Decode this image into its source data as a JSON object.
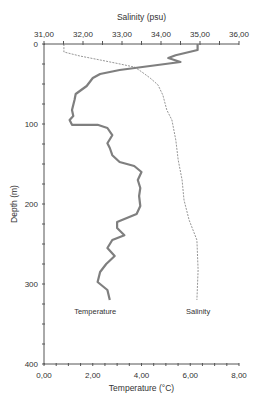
{
  "chart_data": {
    "type": "line",
    "title": "",
    "orientation": "depth-profile",
    "top_axis": {
      "label": "Salinity (psu)",
      "range": [
        31,
        36
      ],
      "ticks": [
        31,
        32,
        33,
        34,
        35,
        36
      ],
      "tick_labels": [
        "31,00",
        "32,00",
        "33,00",
        "34,00",
        "35,00",
        "36,00"
      ]
    },
    "bottom_axis": {
      "label": "Temperature (°C)",
      "range": [
        0,
        8
      ],
      "ticks": [
        0,
        2,
        4,
        6,
        8
      ],
      "tick_labels": [
        "0,00",
        "2,00",
        "4,00",
        "6,00",
        "8,00"
      ]
    },
    "y_axis": {
      "label": "Depth (m)",
      "range": [
        0,
        400
      ],
      "inverted": true,
      "ticks": [
        0,
        100,
        200,
        300,
        400
      ],
      "tick_labels": [
        "0",
        "100",
        "200",
        "300",
        "400"
      ],
      "minor_tick_step": 25
    },
    "grid": false,
    "series": [
      {
        "name": "Temperature",
        "axis": "bottom",
        "style": "solid-thick",
        "color": "#808080",
        "label_pos": {
          "x": 2.1,
          "depth": 337
        },
        "points": [
          [
            6.3,
            0
          ],
          [
            6.3,
            7.5
          ],
          [
            5.4,
            14
          ],
          [
            5.1,
            17.5
          ],
          [
            5.6,
            22.5
          ],
          [
            4.35,
            27.5
          ],
          [
            3.1,
            32.5
          ],
          [
            2.3,
            37.5
          ],
          [
            2.0,
            42.5
          ],
          [
            1.75,
            52.5
          ],
          [
            1.3,
            62.5
          ],
          [
            1.25,
            70
          ],
          [
            1.15,
            82.5
          ],
          [
            1.2,
            90
          ],
          [
            1.05,
            95
          ],
          [
            1.15,
            101
          ],
          [
            2.2,
            101
          ],
          [
            2.6,
            105
          ],
          [
            2.8,
            114
          ],
          [
            2.6,
            124
          ],
          [
            2.7,
            130
          ],
          [
            2.8,
            139
          ],
          [
            3.1,
            147.5
          ],
          [
            3.7,
            152.5
          ],
          [
            4.0,
            160
          ],
          [
            3.85,
            170
          ],
          [
            3.95,
            180
          ],
          [
            3.9,
            190
          ],
          [
            3.95,
            202.5
          ],
          [
            3.8,
            212.5
          ],
          [
            3.0,
            222.5
          ],
          [
            3.0,
            230
          ],
          [
            3.3,
            239
          ],
          [
            2.8,
            245
          ],
          [
            2.6,
            255
          ],
          [
            2.9,
            265
          ],
          [
            2.55,
            275
          ],
          [
            2.3,
            285
          ],
          [
            2.2,
            297.5
          ],
          [
            2.6,
            307.5
          ],
          [
            2.7,
            320
          ]
        ]
      },
      {
        "name": "Salinity",
        "axis": "top",
        "style": "dashed-thin",
        "color": "#888888",
        "label_pos": {
          "x": 34.95,
          "depth": 337
        },
        "points": [
          [
            31.51,
            0
          ],
          [
            31.51,
            10
          ],
          [
            31.92,
            15
          ],
          [
            32.44,
            20
          ],
          [
            32.95,
            25
          ],
          [
            33.33,
            29
          ],
          [
            33.51,
            35
          ],
          [
            33.72,
            42.5
          ],
          [
            33.92,
            51
          ],
          [
            34.05,
            64
          ],
          [
            34.15,
            82.5
          ],
          [
            34.28,
            95
          ],
          [
            34.38,
            120
          ],
          [
            34.44,
            145
          ],
          [
            34.54,
            170
          ],
          [
            34.59,
            195
          ],
          [
            34.72,
            220
          ],
          [
            34.92,
            245
          ],
          [
            34.95,
            282.5
          ],
          [
            34.92,
            320
          ]
        ]
      }
    ]
  }
}
